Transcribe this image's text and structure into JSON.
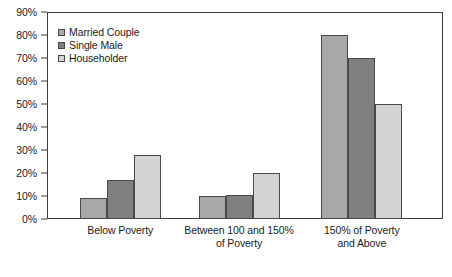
{
  "chart_data": {
    "type": "bar",
    "title": "",
    "subtitle": "",
    "xlabel": "",
    "ylabel": "",
    "ylim": [
      0,
      90
    ],
    "ytick_step": 10,
    "ytick_labels": [
      "0%",
      "10%",
      "20%",
      "30%",
      "40%",
      "50%",
      "60%",
      "70%",
      "80%",
      "90%"
    ],
    "ytick_values": [
      0,
      10,
      20,
      30,
      40,
      50,
      60,
      70,
      80,
      90
    ],
    "grid": false,
    "legend_position": "top-left-inside",
    "categories": [
      "Below Poverty",
      "Between 100 and 150%\nof Poverty",
      "150% of Poverty and Above"
    ],
    "series": [
      {
        "name": "Married Couple",
        "color": "#a8a8a8",
        "values": [
          9,
          10,
          80
        ]
      },
      {
        "name": "Single Male",
        "color": "#808080",
        "values": [
          17,
          10.5,
          70
        ]
      },
      {
        "name": "Householder",
        "color": "#d4d4d4",
        "values": [
          28,
          20,
          50
        ]
      }
    ]
  },
  "style": {
    "frame_color": "#3a3a3a",
    "bar_outline_color": "#4a4a4a",
    "text_color": "#1c1c1c",
    "background": "#ffffff"
  }
}
